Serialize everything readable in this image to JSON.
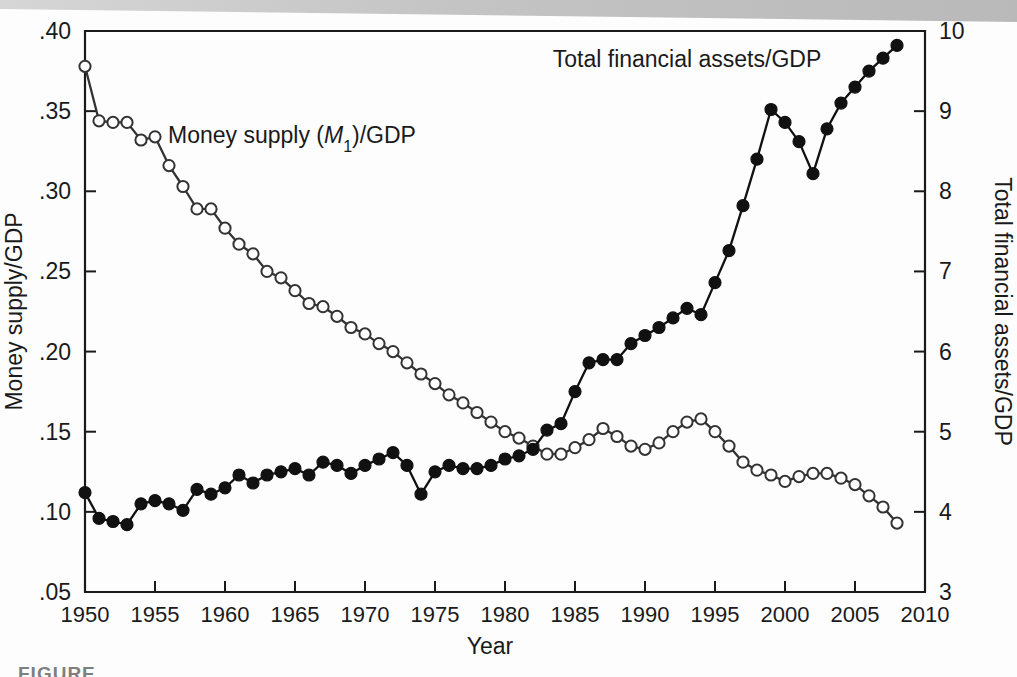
{
  "figure": {
    "caption_partial": "FIGURE",
    "background_color": "#fdfdfd",
    "ink_color": "#1a1a1a",
    "scan_band_color": "#c9c9c9"
  },
  "chart_data": {
    "type": "line",
    "title": "",
    "subtitle": "",
    "xlabel": "Year",
    "ylabel": "Money supply/GDP",
    "y2label": "Total financial assets/GDP",
    "xlim": [
      1950,
      2010
    ],
    "ylim": [
      0.05,
      0.4
    ],
    "y2lim": [
      3,
      10
    ],
    "grid": false,
    "legend_position": "inline-annotation",
    "xticks": [
      1950,
      1955,
      1960,
      1965,
      1970,
      1975,
      1980,
      1985,
      1990,
      1995,
      2000,
      2005,
      2010
    ],
    "xticklabels": [
      "1950",
      "1955",
      "1960",
      "1965",
      "1970",
      "1975",
      "1980",
      "1985",
      "1990",
      "1995",
      "2000",
      "2005",
      "2010"
    ],
    "yticks": [
      0.05,
      0.1,
      0.15,
      0.2,
      0.25,
      0.3,
      0.35,
      0.4
    ],
    "yticklabels": [
      ".05",
      ".10",
      ".15",
      ".20",
      ".25",
      ".30",
      ".35",
      ".40"
    ],
    "y2ticks": [
      3,
      4,
      5,
      6,
      7,
      8,
      9,
      10
    ],
    "y2ticklabels": [
      "3",
      "4",
      "5",
      "6",
      "7",
      "8",
      "9",
      "10"
    ],
    "annotations": [
      {
        "text": "Money supply (M₁)/GDP",
        "x": 1955.5,
        "y_axis": "left",
        "y": 0.335
      },
      {
        "text": "Total financial assets/GDP",
        "x": 1993.0,
        "y_axis": "right",
        "y": 9.55
      }
    ],
    "series": [
      {
        "name": "Money supply (M1)/GDP",
        "axis": "left",
        "marker": "open-circle",
        "marker_fill": "#ffffff",
        "line_color": "#333333",
        "x": [
          1950,
          1951,
          1952,
          1953,
          1954,
          1955,
          1956,
          1957,
          1958,
          1959,
          1960,
          1961,
          1962,
          1963,
          1964,
          1965,
          1966,
          1967,
          1968,
          1969,
          1970,
          1971,
          1972,
          1973,
          1974,
          1975,
          1976,
          1977,
          1978,
          1979,
          1980,
          1981,
          1982,
          1983,
          1984,
          1985,
          1986,
          1987,
          1988,
          1989,
          1990,
          1991,
          1992,
          1993,
          1994,
          1995,
          1996,
          1997,
          1998,
          1999,
          2000,
          2001,
          2002,
          2003,
          2004,
          2005,
          2006,
          2007,
          2008
        ],
        "values": [
          0.378,
          0.344,
          0.343,
          0.343,
          0.332,
          0.334,
          0.316,
          0.303,
          0.289,
          0.289,
          0.277,
          0.267,
          0.261,
          0.25,
          0.246,
          0.238,
          0.23,
          0.228,
          0.222,
          0.215,
          0.211,
          0.205,
          0.2,
          0.193,
          0.186,
          0.18,
          0.173,
          0.168,
          0.162,
          0.156,
          0.15,
          0.146,
          0.141,
          0.136,
          0.136,
          0.14,
          0.145,
          0.152,
          0.147,
          0.141,
          0.139,
          0.143,
          0.15,
          0.156,
          0.158,
          0.15,
          0.141,
          0.131,
          0.126,
          0.123,
          0.119,
          0.122,
          0.124,
          0.124,
          0.121,
          0.117,
          0.11,
          0.103,
          0.093
        ]
      },
      {
        "name": "Total financial assets/GDP",
        "axis": "right",
        "marker": "filled-circle",
        "marker_fill": "#111111",
        "line_color": "#111111",
        "x": [
          1950,
          1951,
          1952,
          1953,
          1954,
          1955,
          1956,
          1957,
          1958,
          1959,
          1960,
          1961,
          1962,
          1963,
          1964,
          1965,
          1966,
          1967,
          1968,
          1969,
          1970,
          1971,
          1972,
          1973,
          1974,
          1975,
          1976,
          1977,
          1978,
          1979,
          1980,
          1981,
          1982,
          1983,
          1984,
          1985,
          1986,
          1987,
          1988,
          1989,
          1990,
          1991,
          1992,
          1993,
          1994,
          1995,
          1996,
          1997,
          1998,
          1999,
          2000,
          2001,
          2002,
          2003,
          2004,
          2005,
          2006,
          2007,
          2008
        ],
        "values": [
          4.24,
          3.92,
          3.88,
          3.84,
          4.1,
          4.14,
          4.1,
          4.02,
          4.28,
          4.22,
          4.3,
          4.46,
          4.36,
          4.46,
          4.5,
          4.54,
          4.46,
          4.62,
          4.58,
          4.48,
          4.58,
          4.66,
          4.74,
          4.58,
          4.22,
          4.5,
          4.58,
          4.54,
          4.54,
          4.58,
          4.66,
          4.7,
          4.78,
          5.02,
          5.1,
          5.5,
          5.86,
          5.9,
          5.9,
          6.1,
          6.2,
          6.3,
          6.42,
          6.54,
          6.46,
          6.86,
          7.26,
          7.82,
          8.4,
          9.02,
          8.86,
          8.62,
          8.22,
          8.78,
          9.1,
          9.3,
          9.5,
          9.66,
          9.82
        ]
      }
    ]
  }
}
